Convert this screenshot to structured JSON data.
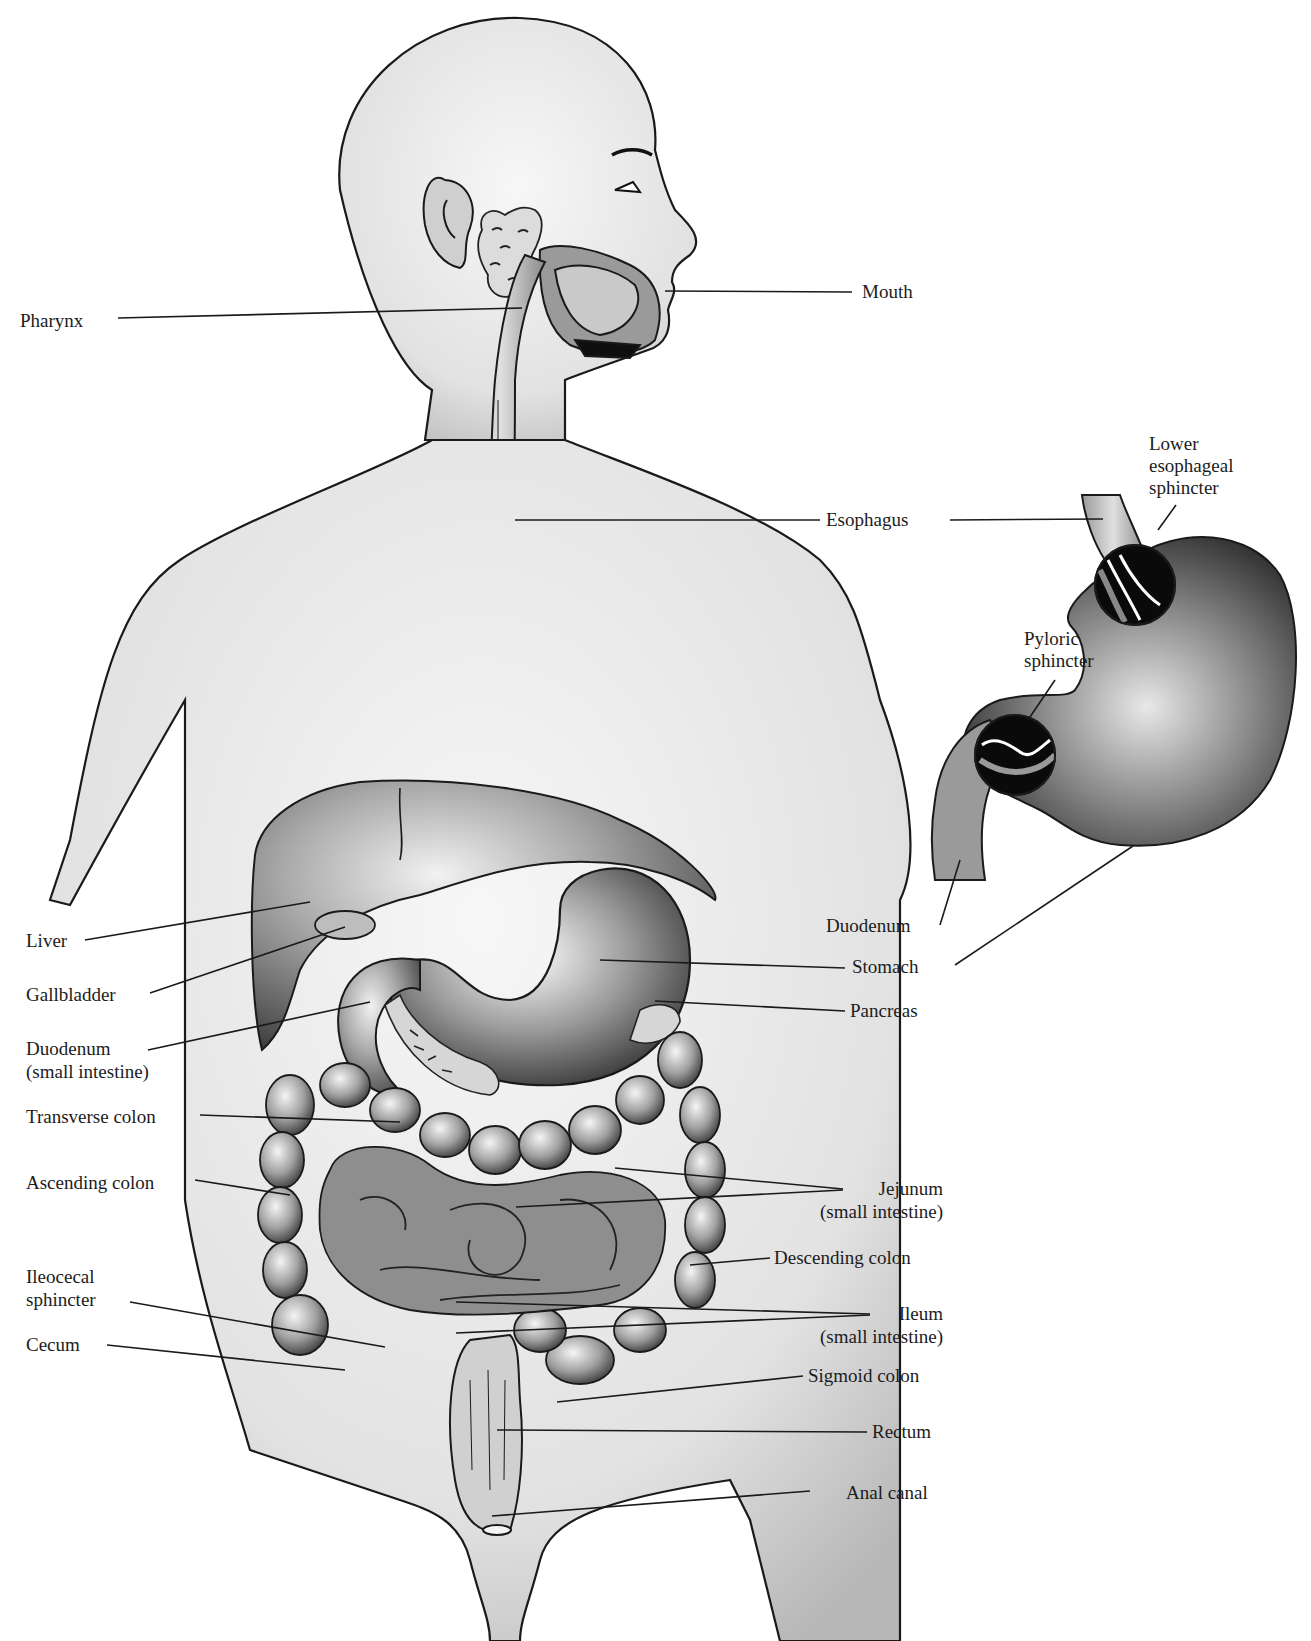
{
  "diagram": {
    "colors": {
      "background": "#ffffff",
      "ink": "#1a1a1a",
      "skin_light": "#eeeeee",
      "skin_mid": "#c8c8c8",
      "organ_dark": "#3a3a3a",
      "organ_black": "#0a0a0a"
    },
    "labels_left": [
      {
        "id": "pharynx",
        "text": "Pharynx"
      },
      {
        "id": "liver",
        "text": "Liver"
      },
      {
        "id": "gallbladder",
        "text": "Gallbladder"
      },
      {
        "id": "duodenum-small",
        "line1": "Duodenum",
        "line2": "(small intestine)"
      },
      {
        "id": "transverse-colon",
        "text": "Transverse colon"
      },
      {
        "id": "ascending-colon",
        "text": "Ascending colon"
      },
      {
        "id": "ileocecal-sphincter",
        "line1": "Ileocecal",
        "line2": "sphincter"
      },
      {
        "id": "cecum",
        "text": "Cecum"
      }
    ],
    "labels_right": [
      {
        "id": "mouth",
        "text": "Mouth"
      },
      {
        "id": "esophagus",
        "text": "Esophagus"
      },
      {
        "id": "stomach",
        "text": "Stomach"
      },
      {
        "id": "pancreas",
        "text": "Pancreas"
      },
      {
        "id": "jejunum",
        "line1": "Jejunum",
        "line2": "(small intestine)"
      },
      {
        "id": "descending-colon",
        "text": "Descending colon"
      },
      {
        "id": "ileum",
        "line1": "Ileum",
        "line2": "(small intestine)"
      },
      {
        "id": "sigmoid-colon",
        "text": "Sigmoid colon"
      },
      {
        "id": "rectum",
        "text": "Rectum"
      },
      {
        "id": "anal-canal",
        "text": "Anal canal"
      }
    ],
    "inset": {
      "title": "Stomach detail",
      "labels": [
        {
          "id": "lower-esophageal-sphincter",
          "line1": "Lower",
          "line2": "esophageal",
          "line3": "sphincter"
        },
        {
          "id": "pyloric-sphincter",
          "line1": "Pyloric",
          "line2": "sphincter"
        },
        {
          "id": "duodenum-inset",
          "text": "Duodenum"
        }
      ]
    }
  }
}
